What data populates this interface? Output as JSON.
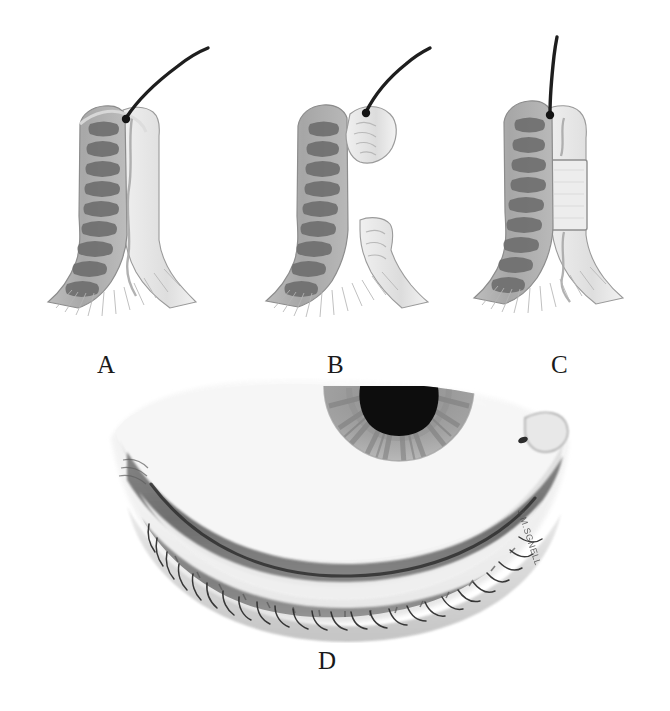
{
  "figure": {
    "background_color": "#ffffff",
    "width": 670,
    "height": 711,
    "artist_signature": "J.M.SGNELL"
  },
  "panels": [
    {
      "id": "a",
      "label": "A",
      "name": "normal-eyelid-cross-section",
      "description": "Sagittal cross-section of eyelid margin showing intact tarsal plate with meibomian glands and a single cilium emerging at the lid margin."
    },
    {
      "id": "b",
      "label": "B",
      "name": "eyelid-cross-section-excised-segment",
      "description": "Same cross-section with a wedge of the anterior lamella and lid margin excised and displaced, the cilium still attached to the freed fragment."
    },
    {
      "id": "c",
      "label": "C",
      "name": "eyelid-cross-section-with-graft",
      "description": "Cross-section after repair, a pale rectangular graft interposed in the posterior lamella between the tarsal plate and the margin."
    },
    {
      "id": "d",
      "label": "D",
      "name": "everted-lower-eyelid-frontal-view",
      "description": "Frontal view of the everted lower eyelid showing the inferior half of the iris with black pupil above, the conjunctival and tarsal bands, the grey line of the lid margin and the row of cilia."
    }
  ],
  "palette": {
    "paper": "#ffffff",
    "ink_dark": "#1a1a1a",
    "gland_dark": "#6d6d6d",
    "gland_mid": "#8d8d8d",
    "tarsus_light": "#c9c9c9",
    "tarsus_mid": "#b0b0b0",
    "skin_pale": "#e4e4e4",
    "band_dark": "#6a6a6a",
    "band_mid": "#888888",
    "outline": "#777777",
    "pupil": "#0d0d0d",
    "iris": "#9a9a9a",
    "lash": "#2b2b2b"
  },
  "anatomy_features": {
    "cilium": "eyelash",
    "meibomian_glands": "vertical row of dark lobulated glands within tarsus",
    "tarsal_plate": "pale fibrous plate",
    "lid_margin": "grey line with meibomian orifices",
    "iris": "radially striated iris with central black pupil",
    "graft": "pale interpositional posterior lamellar graft"
  }
}
